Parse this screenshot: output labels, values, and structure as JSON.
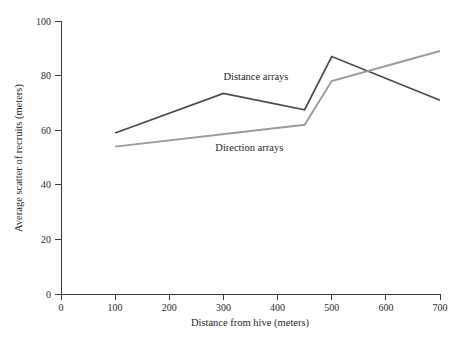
{
  "chart_data": {
    "type": "line",
    "title": "",
    "xlabel": "Distance from hive (meters)",
    "ylabel": "Average scatter of recruits (meters)",
    "xlim": [
      0,
      700
    ],
    "ylim": [
      0,
      100
    ],
    "xticks": [
      0,
      100,
      200,
      300,
      400,
      500,
      600,
      700
    ],
    "yticks": [
      0,
      20,
      40,
      60,
      80,
      100
    ],
    "xtick_labels": [
      "0",
      "100",
      "200",
      "300",
      "400",
      "500",
      "600",
      "700"
    ],
    "ytick_labels": [
      "0",
      "20",
      "40",
      "60",
      "80",
      "100"
    ],
    "grid": false,
    "legend_position": "inline-annotation",
    "series": [
      {
        "name": "Distance arrays",
        "color": "#4a4a4a",
        "x": [
          100,
          300,
          450,
          500,
          700
        ],
        "values": [
          59,
          73.5,
          67.5,
          87,
          71
        ]
      },
      {
        "name": "Direction arrays",
        "color": "#9b9b9b",
        "x": [
          100,
          450,
          500,
          700
        ],
        "values": [
          54,
          62,
          78,
          89
        ]
      }
    ],
    "annotations": [
      {
        "text": "Distance arrays",
        "x": 300,
        "y": 78.5
      },
      {
        "text": "Direction arrays",
        "x": 285,
        "y": 52.5
      }
    ]
  },
  "colors": {
    "axis": "#3d3d3d",
    "text": "#1f1f1f",
    "background": "#ffffff",
    "series_distance": "#4a4a4a",
    "series_direction": "#9b9b9b"
  }
}
